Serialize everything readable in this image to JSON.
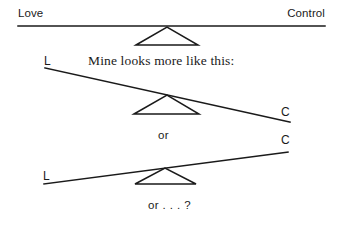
{
  "figure": {
    "stroke_color": "#1a1a1a",
    "background_color": "#ffffff"
  },
  "scales": {
    "top": {
      "name": "balanced-scale",
      "left_label": "Love",
      "right_label": "Control",
      "state": "level",
      "beam": {
        "x1": 18,
        "y1": 26,
        "x2": 325,
        "y2": 26
      },
      "fulcrum": {
        "apex_x": 167,
        "apex_y": 27,
        "base_left_x": 136,
        "base_right_x": 198,
        "base_y": 45
      }
    },
    "middle": {
      "name": "control-heavy-scale",
      "left_label": "L",
      "right_label": "C",
      "state": "tilted-toward-control",
      "beam": {
        "x1": 45,
        "y1": 68,
        "x2": 290,
        "y2": 122
      },
      "fulcrum": {
        "apex_x": 167,
        "apex_y": 95,
        "base_left_x": 134,
        "base_right_x": 199,
        "base_y": 114
      }
    },
    "bottom": {
      "name": "love-heavy-scale",
      "left_label": "L",
      "right_label": "C",
      "state": "tilted-toward-love",
      "beam": {
        "x1": 44,
        "y1": 184,
        "x2": 288,
        "y2": 152
      },
      "fulcrum": {
        "apex_x": 165,
        "apex_y": 168,
        "base_left_x": 135,
        "base_right_x": 196,
        "base_y": 184
      }
    }
  },
  "captions": {
    "intro": "Mine looks more like this:",
    "or_first": "or",
    "or_second": "or . . . ?"
  }
}
